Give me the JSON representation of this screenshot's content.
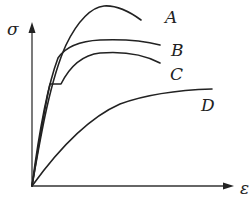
{
  "diagram": {
    "axes": {
      "y_label": "σ",
      "x_label": "ε",
      "origin": [
        32,
        186
      ],
      "y_arrow_tip": [
        32,
        22
      ],
      "x_arrow_tip": [
        234,
        186
      ]
    },
    "curves": [
      {
        "id": "A",
        "label": "A",
        "description": "High strength, rises steeply to a pronounced peak then drops",
        "path": "M32,186 C40,140 50,80 66,45 C78,20 92,7 104,6 C118,5 130,12 141,20",
        "label_pos": [
          165,
          23
        ]
      },
      {
        "id": "B",
        "label": "B",
        "description": "Steep initial rise, then flat high plateau",
        "path": "M32,186 C38,140 46,90 58,58 C66,46 80,41 100,40 C125,39 145,41 160,45",
        "label_pos": [
          171,
          56
        ]
      },
      {
        "id": "C",
        "label": "C",
        "description": "Linear elastic, distinct yield plateau, strain hardening, then necking",
        "path": "M32,186 C38,150 44,110 50,84 L61,84 C70,66 82,55 100,53 C124,51 145,55 160,63",
        "label_pos": [
          170,
          80
        ]
      },
      {
        "id": "D",
        "label": "D",
        "description": "Low stiffness, gradual nonlinear rise",
        "path": "M32,186 C58,150 88,118 120,104 C150,93 180,90 212,89",
        "label_pos": [
          201,
          111
        ]
      }
    ]
  }
}
